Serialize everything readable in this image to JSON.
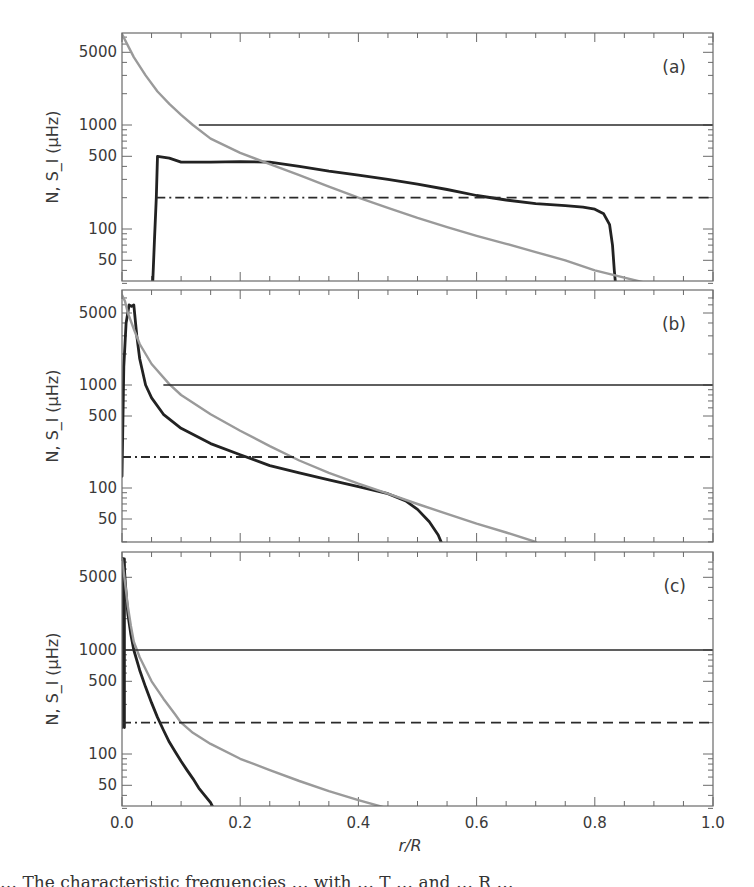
{
  "figure": {
    "x_axis_title": "r/R",
    "y_axis_title": "N, S_l (μHz)",
    "caption_fragment": "… The characteristic frequencies … with … T … and … R … "
  },
  "chart_data": {
    "type": "line",
    "layout": {
      "panels": 3,
      "stacked": "vertical",
      "shared_x_axis": true,
      "grid": false,
      "legend": "none",
      "y_scale": "log"
    },
    "xlabel": "r/R",
    "ylabel": "N, S_l (μHz)",
    "xlim": [
      0.0,
      1.0
    ],
    "x_ticks": [
      "0.0",
      "0.2",
      "0.4",
      "0.6",
      "0.8",
      "1.0"
    ],
    "y_ticks": [
      "50",
      "100",
      "500",
      "1000",
      "5000"
    ],
    "panels": [
      {
        "label": "(a)",
        "ylim": [
          30,
          7500
        ],
        "series": [
          {
            "name": "N (buoyancy frequency)",
            "style": "solid-thick-black",
            "x": [
              0.052,
              0.055,
              0.058,
              0.06,
              0.08,
              0.1,
              0.15,
              0.2,
              0.25,
              0.3,
              0.35,
              0.4,
              0.45,
              0.5,
              0.55,
              0.6,
              0.65,
              0.7,
              0.75,
              0.78,
              0.8,
              0.815,
              0.825,
              0.83,
              0.833,
              0.835
            ],
            "y": [
              30,
              80,
              200,
              500,
              480,
              440,
              440,
              445,
              440,
              400,
              360,
              330,
              300,
              270,
              240,
              210,
              190,
              175,
              168,
              162,
              155,
              140,
              110,
              70,
              40,
              30
            ]
          },
          {
            "name": "S_l (Lamb frequency)",
            "style": "solid-gray",
            "x": [
              0.0,
              0.02,
              0.04,
              0.06,
              0.08,
              0.1,
              0.12,
              0.15,
              0.2,
              0.25,
              0.3,
              0.35,
              0.4,
              0.45,
              0.5,
              0.55,
              0.6,
              0.65,
              0.7,
              0.75,
              0.8,
              0.85,
              0.89
            ],
            "y": [
              7500,
              4500,
              3000,
              2100,
              1600,
              1250,
              1000,
              740,
              540,
              420,
              330,
              255,
              200,
              160,
              128,
              104,
              86,
              72,
              60,
              50,
              40,
              34,
              30
            ]
          },
          {
            "name": "nu_max (upper)",
            "style": "thin-solid-black",
            "x_start": 0.13,
            "x_end": 1.0,
            "y": 1000
          },
          {
            "name": "nu (dash-dot then dashed)",
            "style": "dashdot-to-dashed",
            "x_start": 0.058,
            "x_switch": 0.38,
            "x_end": 1.0,
            "y": 200
          }
        ]
      },
      {
        "label": "(b)",
        "ylim": [
          30,
          7500
        ],
        "series": [
          {
            "name": "N (buoyancy frequency)",
            "style": "solid-thick-black",
            "x": [
              0.0,
              0.003,
              0.007,
              0.012,
              0.016,
              0.02,
              0.025,
              0.03,
              0.04,
              0.05,
              0.07,
              0.1,
              0.15,
              0.2,
              0.25,
              0.3,
              0.35,
              0.4,
              0.45,
              0.48,
              0.5,
              0.52,
              0.535,
              0.54
            ],
            "y": [
              130,
              1500,
              4000,
              6000,
              5800,
              6000,
              3000,
              1800,
              1000,
              750,
              520,
              380,
              270,
              210,
              165,
              140,
              120,
              103,
              88,
              75,
              62,
              47,
              35,
              30
            ]
          },
          {
            "name": "S_l (Lamb frequency)",
            "style": "solid-gray",
            "x": [
              0.0,
              0.005,
              0.01,
              0.02,
              0.03,
              0.05,
              0.08,
              0.1,
              0.15,
              0.2,
              0.25,
              0.3,
              0.35,
              0.4,
              0.45,
              0.5,
              0.55,
              0.6,
              0.65,
              0.7
            ],
            "y": [
              7500,
              6500,
              5000,
              3500,
              2500,
              1600,
              1020,
              800,
              520,
              360,
              255,
              185,
              140,
              110,
              88,
              70,
              56,
              45,
              37,
              30
            ]
          },
          {
            "name": "nu_max (upper)",
            "style": "thin-solid-black",
            "x_start": 0.07,
            "x_end": 1.0,
            "y": 1000
          },
          {
            "name": "nu (dash-dot then dashed)",
            "style": "dashdot-to-dashed",
            "x_start": 0.0,
            "x_switch": 0.22,
            "x_end": 1.0,
            "y": 200
          }
        ]
      },
      {
        "label": "(c)",
        "ylim": [
          30,
          7500
        ],
        "series": [
          {
            "name": "N (buoyancy frequency)",
            "style": "solid-thick-black",
            "x": [
              0.0,
              0.002,
              0.004,
              0.006,
              0.008,
              0.01,
              0.015,
              0.02,
              0.03,
              0.04,
              0.05,
              0.06,
              0.07,
              0.08,
              0.09,
              0.1,
              0.11,
              0.12,
              0.13,
              0.14,
              0.15,
              0.155
            ],
            "y": [
              7500,
              7500,
              6000,
              4200,
              3000,
              2200,
              1400,
              1000,
              640,
              440,
              310,
              225,
              170,
              130,
              105,
              85,
              70,
              58,
              47,
              40,
              34,
              30
            ]
          },
          {
            "name": "N (inner spike)",
            "style": "solid-thick-black",
            "x": [
              0.0,
              0.0,
              0.004,
              0.004
            ],
            "y": [
              180,
              7500,
              7500,
              180
            ]
          },
          {
            "name": "S_l (Lamb frequency)",
            "style": "solid-gray",
            "x": [
              0.0,
              0.005,
              0.01,
              0.015,
              0.02,
              0.03,
              0.05,
              0.07,
              0.09,
              0.1,
              0.12,
              0.15,
              0.2,
              0.25,
              0.3,
              0.35,
              0.4,
              0.45
            ],
            "y": [
              7500,
              4500,
              2600,
              1700,
              1200,
              850,
              500,
              340,
              240,
              200,
              160,
              125,
              90,
              70,
              55,
              44,
              36,
              30
            ]
          },
          {
            "name": "nu_max (upper)",
            "style": "thin-solid-black",
            "x_start": 0.0,
            "x_end": 1.0,
            "y": 1000
          },
          {
            "name": "nu (dash-dot then dashed)",
            "style": "dashdot-to-dashed",
            "x_start": 0.0,
            "x_switch": 0.11,
            "x_end": 1.0,
            "y": 200
          }
        ]
      }
    ]
  }
}
